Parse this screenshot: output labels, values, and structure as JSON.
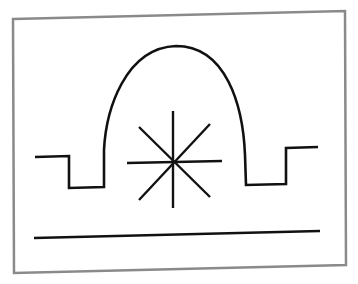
{
  "diagram": {
    "colors": {
      "background": "#ffffff",
      "frame": "#8a8a8a",
      "stroke": "#111111"
    },
    "frame": {
      "points": "13,19 345,11 346,265 14,273"
    },
    "elements": {
      "dome_profile": "M35,157 L69,156 L69,188 L104,187 L104,150 C106,110 125,48 176,46 C226,46 243,105 245,155 L246,185 L286,184 L286,148 L318,147",
      "star_center": [
        173,
        162
      ],
      "star_rays": [
        [
          173,
          111,
          173,
          208
        ],
        [
          127,
          163,
          222,
          161
        ],
        [
          139,
          127,
          210,
          197
        ],
        [
          139,
          200,
          210,
          124
        ]
      ],
      "ground_line": [
        34,
        238,
        320,
        231
      ]
    }
  }
}
